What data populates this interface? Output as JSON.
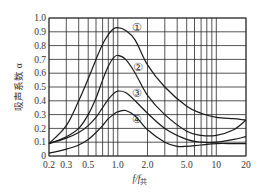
{
  "chart_data": {
    "type": "line",
    "title": "",
    "xlabel": "f/f共",
    "xlabel_main": "f/f",
    "xlabel_sub": "共",
    "ylabel": "吸声系数 α",
    "xscale": "log",
    "xlim": [
      0.2,
      20
    ],
    "ylim": [
      0,
      1.0
    ],
    "grid": true,
    "x_ticks": [
      0.2,
      0.3,
      0.5,
      1.0,
      2.0,
      5.0,
      10,
      20
    ],
    "x_tick_labels": [
      "0.2",
      "0.3",
      "0.5",
      "1.0",
      "2.0",
      "5.0",
      "10",
      "20"
    ],
    "x_grid": [
      0.2,
      0.3,
      0.4,
      0.5,
      0.6,
      0.7,
      0.8,
      0.9,
      1.0,
      2.0,
      3.0,
      4.0,
      5.0,
      6.0,
      7.0,
      8.0,
      9.0,
      10,
      20
    ],
    "y_ticks": [
      0,
      0.1,
      0.2,
      0.3,
      0.4,
      0.5,
      0.6,
      0.7,
      0.8,
      0.9,
      1.0
    ],
    "y_tick_labels": [
      "0",
      "0.1",
      "0.2",
      "0.3",
      "0.4",
      "0.5",
      "0.6",
      "0.7",
      "0.8",
      "0.9",
      "1.0"
    ],
    "legend": "curves labeled inline with circled numerals",
    "series": [
      {
        "name": "①",
        "label_pos": [
          1.55,
          0.93
        ],
        "x": [
          0.2,
          0.3,
          0.4,
          0.5,
          0.6,
          0.7,
          0.8,
          0.9,
          1.0,
          1.2,
          1.5,
          2.0,
          3.0,
          5.0,
          7.0,
          10,
          15,
          20
        ],
        "values": [
          0.09,
          0.22,
          0.4,
          0.56,
          0.7,
          0.81,
          0.88,
          0.92,
          0.93,
          0.91,
          0.84,
          0.66,
          0.5,
          0.36,
          0.31,
          0.28,
          0.27,
          0.26
        ]
      },
      {
        "name": "②",
        "label_pos": [
          1.6,
          0.64
        ],
        "x": [
          0.2,
          0.3,
          0.4,
          0.5,
          0.6,
          0.7,
          0.8,
          0.9,
          1.0,
          1.2,
          1.5,
          2.0,
          3.0,
          5.0,
          7.0,
          10,
          15,
          20
        ],
        "values": [
          0.09,
          0.14,
          0.2,
          0.3,
          0.42,
          0.55,
          0.65,
          0.71,
          0.73,
          0.7,
          0.6,
          0.44,
          0.3,
          0.18,
          0.15,
          0.15,
          0.19,
          0.26
        ]
      },
      {
        "name": "③",
        "label_pos": [
          1.55,
          0.45
        ],
        "x": [
          0.2,
          0.3,
          0.4,
          0.5,
          0.6,
          0.7,
          0.8,
          0.9,
          1.0,
          1.2,
          1.5,
          2.0,
          3.0,
          5.0,
          7.0,
          10,
          15,
          20
        ],
        "values": [
          0.09,
          0.13,
          0.17,
          0.22,
          0.28,
          0.35,
          0.41,
          0.45,
          0.47,
          0.46,
          0.4,
          0.31,
          0.2,
          0.12,
          0.1,
          0.1,
          0.12,
          0.14
        ]
      },
      {
        "name": "④",
        "label_pos": [
          1.55,
          0.26
        ],
        "x": [
          0.2,
          0.3,
          0.4,
          0.5,
          0.6,
          0.7,
          0.8,
          0.9,
          1.0,
          1.2,
          1.5,
          2.0,
          3.0,
          4.0,
          5.0,
          7.0,
          10,
          15,
          20
        ],
        "values": [
          0.02,
          0.05,
          0.08,
          0.12,
          0.17,
          0.22,
          0.27,
          0.3,
          0.32,
          0.33,
          0.29,
          0.19,
          0.1,
          0.07,
          0.07,
          0.08,
          0.09,
          0.09,
          0.09
        ]
      }
    ]
  }
}
